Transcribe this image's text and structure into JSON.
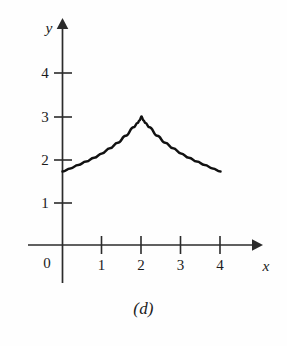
{
  "figure": {
    "caption": "(d)",
    "background_color": "#fefefe",
    "curve_color": "#111111",
    "axis_color": "#2b2b2b"
  },
  "axes": {
    "x_label": "x",
    "y_label": "y",
    "origin_label": "0",
    "x_tick_labels": [
      "1",
      "2",
      "3",
      "4"
    ],
    "y_tick_labels": [
      "1",
      "2",
      "3",
      "4"
    ]
  },
  "chart_data": {
    "type": "line",
    "title": "",
    "subtitle": "",
    "xlabel": "x",
    "ylabel": "y",
    "xlim": [
      -0.9,
      5.0
    ],
    "ylim": [
      -0.9,
      5.3
    ],
    "xticks": [
      1,
      2,
      3,
      4
    ],
    "yticks": [
      1,
      2,
      3,
      4
    ],
    "xticklabels": [
      "1",
      "2",
      "3",
      "4"
    ],
    "yticklabels": [
      "1",
      "2",
      "3",
      "4"
    ],
    "origin_label": "0",
    "grid": false,
    "legend": null,
    "legend_position": "none",
    "annotations": [
      "(d)"
    ],
    "series": [
      {
        "name": "curve",
        "formula": "y = 3 - 1.28 * |x - 2|^(2/3)",
        "x": [
          0.0,
          0.2,
          0.4,
          0.6,
          0.8,
          1.0,
          1.2,
          1.4,
          1.6,
          1.8,
          1.9,
          1.95,
          2.0,
          2.05,
          2.1,
          2.2,
          2.4,
          2.6,
          2.8,
          3.0,
          3.2,
          3.4,
          3.6,
          3.8,
          4.0
        ],
        "y": [
          1.72,
          1.79,
          1.87,
          1.95,
          2.04,
          2.14,
          2.26,
          2.39,
          2.55,
          2.75,
          2.85,
          2.91,
          3.0,
          2.91,
          2.85,
          2.75,
          2.55,
          2.39,
          2.26,
          2.14,
          2.04,
          1.95,
          1.87,
          1.79,
          1.72
        ]
      }
    ],
    "cusp_point": {
      "x": 2,
      "y": 3
    },
    "endpoints": [
      {
        "x": 0,
        "y": 1.72
      },
      {
        "x": 4,
        "y": 1.72
      }
    ]
  }
}
